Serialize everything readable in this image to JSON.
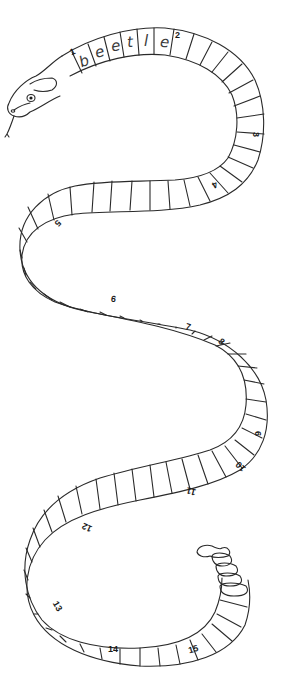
{
  "word": {
    "letters": [
      "b",
      "e",
      "e",
      "t",
      "l",
      "e"
    ]
  },
  "numbers": {
    "n1": "1",
    "n2": "2",
    "n3": "3",
    "n4": "4",
    "n5": "5",
    "n6": "6",
    "n7": "7",
    "n8": "8",
    "n9": "9",
    "n10": "10",
    "n11": "11",
    "n12": "12",
    "n13": "13",
    "n14": "14",
    "n15": "15"
  },
  "colors": {
    "line": "#2a2a2a",
    "background": "#ffffff"
  }
}
